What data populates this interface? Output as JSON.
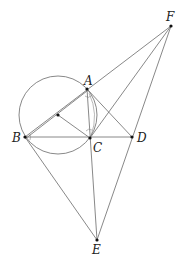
{
  "figure": {
    "type": "geometry-diagram",
    "width": 187,
    "height": 268,
    "stroke_color": "#6a6a6a",
    "point_color": "#111111",
    "points": {
      "A": {
        "x": 87,
        "y": 89,
        "label": "A",
        "lx": 84,
        "ly": 85
      },
      "B": {
        "x": 25,
        "y": 137,
        "label": "B",
        "lx": 12,
        "ly": 142
      },
      "C": {
        "x": 90,
        "y": 138,
        "label": "C",
        "lx": 93,
        "ly": 152
      },
      "D": {
        "x": 132,
        "y": 137,
        "label": "D",
        "lx": 137,
        "ly": 142
      },
      "E": {
        "x": 97,
        "y": 240,
        "label": "E",
        "lx": 92,
        "ly": 254
      },
      "F": {
        "x": 171,
        "y": 26,
        "label": "F",
        "lx": 166,
        "ly": 21
      },
      "O": {
        "x": 58,
        "y": 115,
        "label": ""
      }
    },
    "circle": {
      "cx": 58,
      "cy": 115,
      "r": 39
    },
    "segments": [
      [
        "B",
        "F"
      ],
      [
        "B",
        "A"
      ],
      [
        "B",
        "D"
      ],
      [
        "B",
        "E"
      ],
      [
        "A",
        "D"
      ],
      [
        "A",
        "E"
      ],
      [
        "O",
        "C"
      ],
      [
        "O",
        "B"
      ],
      [
        "F",
        "C"
      ],
      [
        "F",
        "E"
      ]
    ]
  },
  "labels": {
    "A": "A",
    "B": "B",
    "C": "C",
    "D": "D",
    "E": "E",
    "F": "F"
  }
}
